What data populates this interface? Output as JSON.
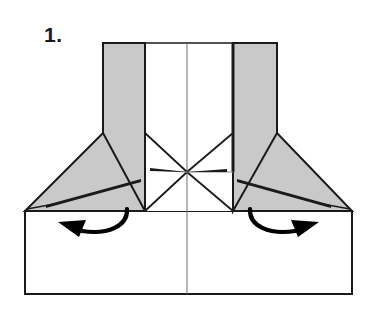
{
  "figure": {
    "step_label": "1.",
    "type": "origami-fold-diagram",
    "caption_text": "",
    "canvas": {
      "width": 372,
      "height": 313
    },
    "colors": {
      "background": "#ffffff",
      "paper_front": "#ffffff",
      "paper_back_shaded": "#c9c9c9",
      "outline": "#1a1a1a",
      "crease_thin": "#555555",
      "arrow": "#000000"
    },
    "geometry": {
      "base_rect": {
        "left": 25,
        "right": 352,
        "top": 211,
        "bottom": 294
      },
      "center_line_x": 187,
      "top_edge_y": 43,
      "column_left_x": 103,
      "column_left_inner_x": 145,
      "column_right_inner_x": 233,
      "column_right_x": 277,
      "fold_line_y": 133,
      "cross_point": {
        "x": 187,
        "y": 172
      },
      "left_flap_apex": {
        "x": 25,
        "y": 211
      },
      "right_flap_apex": {
        "x": 352,
        "y": 211
      }
    },
    "shaded_regions": [
      {
        "name": "left-vertical-panel",
        "shaded": true
      },
      {
        "name": "right-vertical-panel",
        "shaded": true
      },
      {
        "name": "left-triangular-flap",
        "shaded": true
      },
      {
        "name": "right-triangular-flap",
        "shaded": true
      }
    ],
    "arrows": [
      {
        "name": "left-fold-arrow",
        "direction": "counter-clockwise-left",
        "from_x": 127,
        "from_y": 210,
        "to_x": 60,
        "to_y": 222
      },
      {
        "name": "right-fold-arrow",
        "direction": "clockwise-right",
        "from_x": 250,
        "from_y": 210,
        "to_x": 318,
        "to_y": 222
      }
    ]
  }
}
